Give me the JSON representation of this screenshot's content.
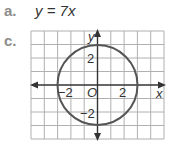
{
  "part_a": {
    "label": "a.",
    "equation": "y = 7x"
  },
  "part_c": {
    "label": "c.",
    "graph": {
      "x_axis_label": "x",
      "y_axis_label": "y",
      "origin_label": "O",
      "tick_labels": {
        "x_neg": "−2",
        "x_pos": "2",
        "y_pos": "2",
        "y_neg": "−2"
      },
      "x_range": [
        -5,
        5
      ],
      "y_range": [
        -4,
        4
      ],
      "circle": {
        "center": [
          0,
          0
        ],
        "radius": 3
      },
      "colors": {
        "grid": "#b0b0b0",
        "axis": "#333333",
        "circle": "#555555"
      }
    }
  }
}
